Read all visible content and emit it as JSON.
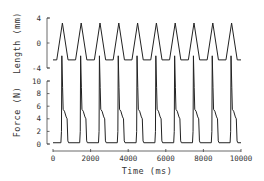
{
  "chart_data": {
    "type": "line",
    "layout": "two stacked panels sharing x-axis",
    "xlabel": "Time (ms)",
    "xlim": [
      0,
      10000
    ],
    "x_ticks": [
      0,
      2000,
      4000,
      6000,
      8000,
      10000
    ],
    "x_tick_labels": [
      "0",
      "2000",
      "4000",
      "6000",
      "8000",
      "10000"
    ],
    "grid": false,
    "legend": null,
    "panels": [
      {
        "name": "length",
        "ylabel": "Length (mm)",
        "ylim": [
          -4,
          4
        ],
        "y_ticks": [
          -4,
          0,
          4
        ],
        "y_tick_labels": [
          "-4",
          "0",
          "4"
        ],
        "series": [
          {
            "name": "Length",
            "description": "Triangular length oscillation, period 1000 ms, 10 cycles",
            "baseline": -2.7,
            "peak": 3.2,
            "period_ms": 1000,
            "peak_times_ms": [
              500,
              1500,
              2500,
              3500,
              4500,
              5500,
              6500,
              7500,
              8500,
              9500
            ]
          }
        ]
      },
      {
        "name": "force",
        "ylabel": "Force (N)",
        "ylim": [
          0,
          10
        ],
        "y_ticks": [
          0,
          2,
          4,
          6,
          8,
          10
        ],
        "y_tick_labels": [
          "0",
          "2",
          "4",
          "6",
          "8",
          "10"
        ],
        "series": [
          {
            "name": "Force",
            "description": "Force rises sharply (peaks exceed 10 N, clipped above axis), drops to ~5.5 N plateau, declines to ~4 N then falls to ~0 N; 10 cycles",
            "period_ms": 1000,
            "peak": 14,
            "plateau": 5.5,
            "shoulder": 4,
            "baseline": 0.2,
            "rise_times_ms": [
              450,
              1450,
              2450,
              3450,
              4450,
              5450,
              6450,
              7450,
              8450,
              9450
            ]
          }
        ]
      }
    ]
  },
  "labels": {
    "length_axis": "Length (mm)",
    "force_axis": "Force (N)",
    "time_axis": "Time (ms)"
  }
}
